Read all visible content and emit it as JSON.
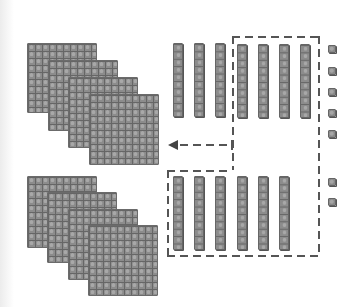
{
  "diagram": {
    "type": "base-ten-blocks-regrouping",
    "colors": {
      "block_fill": "#8c8c8c",
      "block_grid": "#666666",
      "block_highlight": "#a8a8a8",
      "dash_line": "#555555",
      "arrow": "#444444",
      "background": "#ffffff"
    },
    "groups": [
      {
        "name": "top-group",
        "hundreds_flats": 4,
        "tens_rods": 7,
        "ones_units": 5,
        "flats": [
          {
            "x": 27,
            "y": 43,
            "w": 70,
            "h": 70
          },
          {
            "x": 48,
            "y": 60,
            "w": 70,
            "h": 71
          },
          {
            "x": 68,
            "y": 77,
            "w": 70,
            "h": 71
          },
          {
            "x": 89,
            "y": 94,
            "w": 70,
            "h": 71
          }
        ],
        "rods": [
          {
            "x": 173,
            "y": 43
          },
          {
            "x": 194,
            "y": 43
          },
          {
            "x": 215,
            "y": 43
          },
          {
            "x": 237,
            "y": 44
          },
          {
            "x": 258,
            "y": 44
          },
          {
            "x": 279,
            "y": 44
          },
          {
            "x": 300,
            "y": 44
          }
        ],
        "units": [
          {
            "x": 328,
            "y": 45
          },
          {
            "x": 328,
            "y": 67
          },
          {
            "x": 328,
            "y": 88
          },
          {
            "x": 328,
            "y": 109
          },
          {
            "x": 328,
            "y": 130
          }
        ]
      },
      {
        "name": "bottom-group",
        "hundreds_flats": 4,
        "tens_rods": 6,
        "ones_units": 2,
        "flats": [
          {
            "x": 27,
            "y": 176,
            "w": 70,
            "h": 72
          },
          {
            "x": 47,
            "y": 192,
            "w": 70,
            "h": 71
          },
          {
            "x": 68,
            "y": 209,
            "w": 70,
            "h": 71
          },
          {
            "x": 88,
            "y": 225,
            "w": 70,
            "h": 71
          }
        ],
        "rods": [
          {
            "x": 173,
            "y": 176
          },
          {
            "x": 194,
            "y": 176
          },
          {
            "x": 215,
            "y": 176
          },
          {
            "x": 237,
            "y": 176
          },
          {
            "x": 258,
            "y": 176
          },
          {
            "x": 279,
            "y": 176
          }
        ],
        "units": [
          {
            "x": 328,
            "y": 178
          },
          {
            "x": 328,
            "y": 198
          }
        ]
      }
    ],
    "rod_size": {
      "w": 10,
      "h": 74
    },
    "annotations": {
      "dashed_box_top": {
        "x1": 232,
        "x2": 318,
        "y": 36
      },
      "dashed_box_right": {
        "x": 318,
        "y1": 36,
        "y2": 255
      },
      "dashed_divider": {
        "x": 232,
        "y1": 36,
        "y2": 170
      },
      "dashed_box_lower_top": {
        "x1": 167,
        "x2": 230,
        "y": 170
      },
      "dashed_box_lower_left": {
        "x": 167,
        "y1": 170,
        "y2": 255
      },
      "dashed_box_bottom": {
        "x1": 167,
        "x2": 318,
        "y": 255
      },
      "arrow": {
        "from_x": 232,
        "to_x": 168,
        "y": 144,
        "direction": "left"
      }
    }
  }
}
